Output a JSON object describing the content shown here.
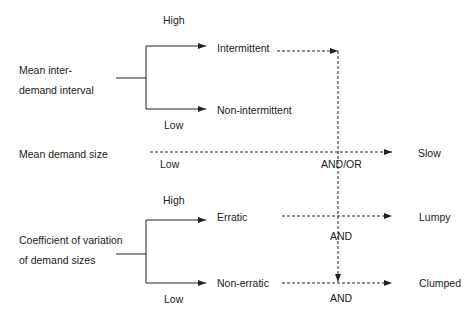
{
  "diagram": {
    "factors": {
      "interval": {
        "label_line1": "Mean inter-",
        "label_line2": "demand interval",
        "high": "High",
        "low": "Low"
      },
      "size": {
        "label": "Mean demand size",
        "low": "Low"
      },
      "cv": {
        "label_line1": "Coefficient of variation",
        "label_line2": "of demand sizes",
        "high": "High",
        "low": "Low"
      }
    },
    "categories": {
      "intermittent": "Intermittent",
      "non_intermittent": "Non-intermittent",
      "erratic": "Erratic",
      "non_erratic": "Non-erratic"
    },
    "connectors": {
      "and_or": "AND/OR",
      "and_upper": "AND",
      "and_lower": "AND"
    },
    "outcomes": {
      "slow": "Slow",
      "lumpy": "Lumpy",
      "clumped": "Clumped"
    },
    "colors": {
      "line": "#222222",
      "background": "#ffffff"
    }
  }
}
